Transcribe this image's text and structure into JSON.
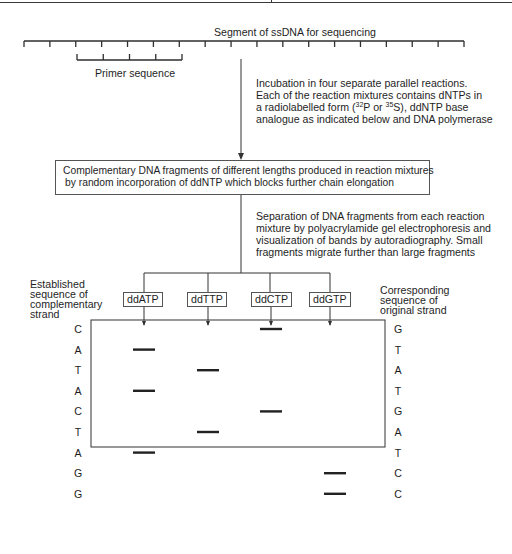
{
  "diagram": {
    "title": "Segment of ssDNA for sequencing",
    "primer_label": "Primer sequence",
    "step1": {
      "line1": "Incubation in four separate parallel reactions.",
      "line2": "Each of the reaction mixtures contains dNTPs in",
      "line3_pre": "a radiolabelled form (",
      "sup1": "32",
      "line3_mid1": "P or ",
      "sup2": "35",
      "line3_mid2": "S), ddNTP base",
      "line4": "analogue as indicated below and DNA polymerase"
    },
    "fragments_box": {
      "line1": "Complementary DNA fragments of different lengths produced in reaction mixtures",
      "line2": "by random incorporation of ddNTP which blocks further chain elongation"
    },
    "step2": {
      "line1": "Separation of DNA fragments from each reaction",
      "line2": "mixture by polyacrylamide gel electrophoresis and",
      "line3": "visualization of bands by autoradiography. Small",
      "line4": "fragments migrate further than large fragments"
    },
    "left_header": {
      "line1": "Established",
      "line2": "sequence of",
      "line3": "complementary",
      "line4": "strand"
    },
    "right_header": {
      "line1": "Corresponding",
      "line2": "sequence of",
      "line3": "original strand"
    },
    "lanes": [
      {
        "label": "ddATP"
      },
      {
        "label": "ddTTP"
      },
      {
        "label": "ddCTP"
      },
      {
        "label": "ddGTP"
      }
    ],
    "rows": [
      {
        "complementary": "C",
        "original": "G",
        "lane": 2
      },
      {
        "complementary": "A",
        "original": "T",
        "lane": 0
      },
      {
        "complementary": "T",
        "original": "A",
        "lane": 1
      },
      {
        "complementary": "A",
        "original": "T",
        "lane": 0
      },
      {
        "complementary": "C",
        "original": "G",
        "lane": 2
      },
      {
        "complementary": "T",
        "original": "A",
        "lane": 1
      },
      {
        "complementary": "A",
        "original": "T",
        "lane": 0
      },
      {
        "complementary": "G",
        "original": "C",
        "lane": 3
      },
      {
        "complementary": "G",
        "original": "C",
        "lane": 3
      }
    ],
    "ssdna_tick_count": 18,
    "primer_tick_count": 5
  }
}
